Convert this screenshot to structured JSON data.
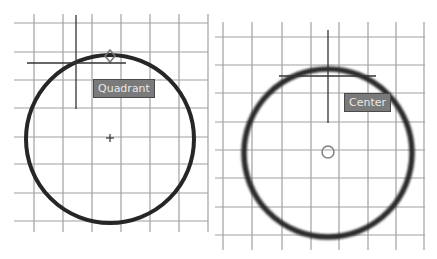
{
  "panels": [
    {
      "id": "left",
      "snap_mode": "Quadrant",
      "tooltip_label": "Quadrant",
      "grid": {
        "vertical_x": [
          34,
          63,
          92,
          121,
          150,
          179,
          208
        ],
        "horizontal_y": [
          23,
          52,
          80,
          108,
          137,
          164,
          193,
          221
        ],
        "color": "#9a9a9a"
      },
      "circle": {
        "cx": 110,
        "cy": 139,
        "r": 84,
        "stroke": "#2a2a2a",
        "width": 4
      },
      "center_mark": "plus",
      "snap_marker": {
        "shape": "diamond",
        "x": 110,
        "y": 56
      },
      "cursor": {
        "x": 76,
        "y": 63
      }
    },
    {
      "id": "right",
      "snap_mode": "Center",
      "tooltip_label": "Center",
      "grid": {
        "vertical_x": [
          8,
          37,
          67,
          96,
          124,
          153,
          181,
          209
        ],
        "horizontal_y": [
          37,
          65,
          93,
          122,
          150,
          178,
          207,
          235
        ],
        "color": "#9a9a9a"
      },
      "circle": {
        "cx": 113,
        "cy": 153,
        "r": 84,
        "stroke": "#2a2a2a",
        "width": 5
      },
      "snap_marker": {
        "shape": "circle",
        "x": 113,
        "y": 152
      },
      "cursor": {
        "x": 113,
        "y": 76
      }
    }
  ]
}
